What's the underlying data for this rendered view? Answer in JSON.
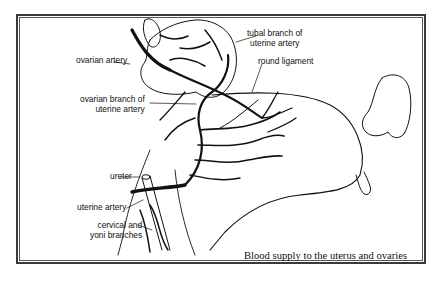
{
  "diagram": {
    "caption": "Blood supply to the uterus and ovaries",
    "labels": {
      "ovarian_artery": "ovarian artery",
      "tubal_branch_line1": "tubal branch of",
      "tubal_branch_line2": "uterine artery",
      "ovarian_branch_line1": "ovarian branch of",
      "ovarian_branch_line2": "uterine artery",
      "round_ligament": "round ligament",
      "ureter": "ureter",
      "uterine_artery": "uterine artery",
      "cervical_line1": "cervical and",
      "cervical_line2": "yoni branches"
    },
    "colors": {
      "ink": "#111111",
      "paper": "#ffffff",
      "border": "#3a3a3a"
    }
  }
}
